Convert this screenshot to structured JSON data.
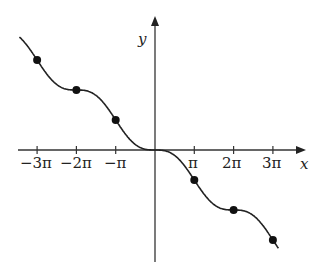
{
  "chart_data": {
    "type": "line",
    "title": "",
    "xlabel": "x",
    "ylabel": "y",
    "function": "y = sin(x) - x",
    "x_tick_labels": [
      "−3π",
      "−2π",
      "−π",
      "π",
      "2π",
      "3π"
    ],
    "x_ticks": [
      -9.4248,
      -6.2832,
      -3.1416,
      3.1416,
      6.2832,
      9.4248
    ],
    "points": [
      {
        "x": "-3π",
        "y": "3π"
      },
      {
        "x": "-2π",
        "y": "2π"
      },
      {
        "x": "-π",
        "y": "π"
      },
      {
        "x": "π",
        "y": "-π"
      },
      {
        "x": "2π",
        "y": "-2π"
      },
      {
        "x": "3π",
        "y": "-3π"
      }
    ],
    "xlim": [
      -11.5,
      13.8
    ],
    "grid": false,
    "legend": "none"
  },
  "labels": {
    "x_axis": "x",
    "y_axis": "y",
    "ticks": [
      "−3π",
      "−2π",
      "−π",
      "π",
      "2π",
      "3π"
    ]
  },
  "colors": {
    "curve": "#222222",
    "axis": "#333333"
  }
}
